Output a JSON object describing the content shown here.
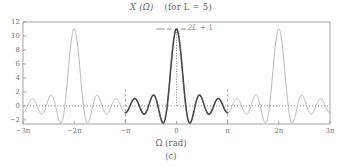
{
  "figure": {
    "caption": "(c)",
    "title_main": "X (Ω)",
    "title_cond": "(for L = 5)",
    "axis_label_x": "Ω (rad)",
    "annotation": "2L + 1"
  },
  "colors": {
    "background": "#ffffff",
    "frame": "#9a9a9a",
    "curve_light": "#a8a8a8",
    "curve_bold": "#4a4a4a",
    "zero_line": "#8f8f8f",
    "marker_line": "#9a9a9a",
    "text": "#666666",
    "tick_text": "#777777"
  },
  "chart_data": {
    "type": "line",
    "xlabel": "Ω (rad)",
    "ylabel": "",
    "grid": false,
    "legend": null,
    "function": "Dirichlet kernel  X(Ω) = sin((2L+1)Ω/2) / sin(Ω/2),  L = 5",
    "parameters": {
      "L": 5,
      "peak_value": 11,
      "period": "2π",
      "main_lobe_halfwidth": "2π/11"
    },
    "xlim": [
      -9.42477796,
      9.42477796
    ],
    "ylim": [
      -2.6,
      12
    ],
    "xticks": [
      -9.42477796,
      -6.28318531,
      -3.14159265,
      0,
      3.14159265,
      6.28318531,
      9.42477796
    ],
    "xticklabels": [
      "−3π",
      "−2π",
      "−π",
      "0",
      "π",
      "2π",
      "3π"
    ],
    "yticks": [
      -2,
      0,
      2,
      4,
      6,
      8,
      10,
      12
    ],
    "yticklabels": [
      "−2",
      "0",
      "2",
      "4",
      "6",
      "8",
      "10",
      "12"
    ],
    "series": [
      {
        "name": "X(Ω) outside principal period",
        "style": "light-solid",
        "color": "#a8a8a8",
        "x_range": [
          -9.42477796,
          9.42477796
        ]
      },
      {
        "name": "X(Ω) principal period",
        "style": "bold-solid",
        "color": "#4a4a4a",
        "x_range": [
          -3.14159265,
          3.14159265
        ]
      }
    ],
    "peaks": [
      {
        "x": -6.28318531,
        "y": 11,
        "label": "−2π"
      },
      {
        "x": 0,
        "y": 11,
        "label": "0"
      },
      {
        "x": 6.28318531,
        "y": 11,
        "label": "2π"
      }
    ],
    "annotations": [
      {
        "text": "2L + 1",
        "value": 11,
        "x": 0,
        "y": 11,
        "style": "dashed-level-marker"
      }
    ],
    "reference_lines": [
      {
        "type": "horizontal",
        "y": 0,
        "style": "dotted"
      },
      {
        "type": "vertical",
        "x": -3.14159265,
        "style": "dashed",
        "partial": true
      },
      {
        "type": "vertical",
        "x": 3.14159265,
        "style": "dashed",
        "partial": true
      },
      {
        "type": "vertical",
        "x": 0,
        "style": "dotted"
      }
    ]
  }
}
